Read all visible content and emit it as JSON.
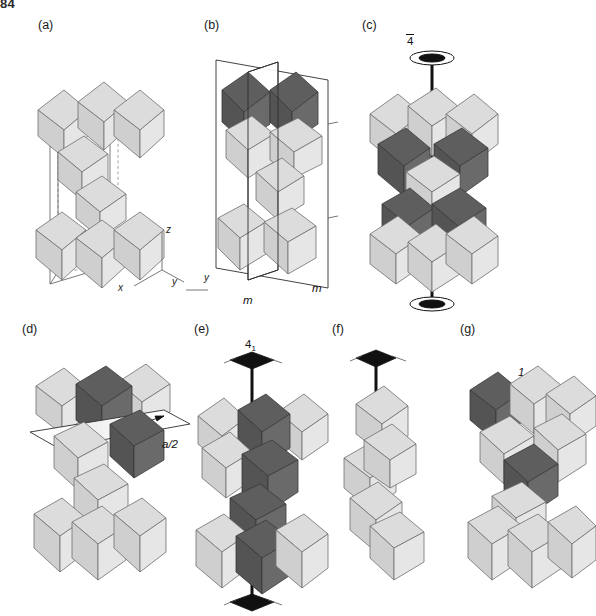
{
  "page": {
    "header": "84",
    "background_color": "#ffffff",
    "width": 596,
    "height": 616
  },
  "figure": {
    "type": "crystallographic-polyhedral-diagram",
    "colors": {
      "octahedron_light": "#dcdcdc",
      "octahedron_dark": "#5e5e5e",
      "outline": "#6e6e6e",
      "symmetry_element": "#111111",
      "unit_cell_line": "#6b6b6b"
    }
  },
  "panels": [
    {
      "id": "a",
      "label": "(a)",
      "symmetry_label": "",
      "caption_elements": [],
      "axes": {
        "x": "x",
        "y": "y",
        "z": "z"
      },
      "has_unit_cell": true,
      "dark_octahedra": 0
    },
    {
      "id": "b",
      "label": "(b)",
      "symmetry_label": "m",
      "mirror_labels": [
        "m",
        "m"
      ],
      "has_unit_cell": true,
      "dark_octahedra": 2,
      "axes": {
        "y": "y"
      }
    },
    {
      "id": "c",
      "label": "(c)",
      "symmetry_label": "4",
      "symmetry_label_overbar": true,
      "symmetry_type": "rotoinversion-axis",
      "has_unit_cell": false,
      "dark_octahedra": 4
    },
    {
      "id": "d",
      "label": "(d)",
      "symmetry_label": "a/2",
      "symmetry_type": "glide-plane",
      "has_unit_cell": false,
      "dark_octahedra": 2
    },
    {
      "id": "e",
      "label": "(e)",
      "symmetry_label": "4",
      "symmetry_label_subscript": "1",
      "symmetry_type": "screw-axis",
      "has_unit_cell": false,
      "dark_octahedra": 5
    },
    {
      "id": "f",
      "label": "(f)",
      "symmetry_label": "",
      "symmetry_type": "rotation-axis",
      "has_unit_cell": false,
      "dark_octahedra": 0
    },
    {
      "id": "g",
      "label": "(g)",
      "symmetry_label": "1",
      "symmetry_type": "identity-inversion-center",
      "has_unit_cell": false,
      "dark_octahedra": 2
    }
  ]
}
